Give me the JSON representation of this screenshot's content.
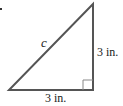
{
  "diagram": {
    "type": "right-triangle",
    "hypotenuse_label": "c",
    "vertical_leg_label": "3 in.",
    "horizontal_leg_label": "3 in.",
    "right_angle_marker": true,
    "colors": {
      "stroke": "#555555",
      "text": "#222222",
      "background": "#ffffff"
    }
  }
}
